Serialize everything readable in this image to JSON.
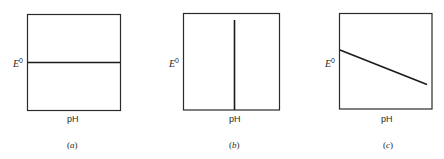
{
  "figure": {
    "panels": [
      {
        "id": "a",
        "caption_letter": "a",
        "ylabel_symbol": "E",
        "ylabel_superscript": "0",
        "xlabel": "pH",
        "line_type": "horizontal"
      },
      {
        "id": "b",
        "caption_letter": "b",
        "ylabel_symbol": "E",
        "ylabel_superscript": "0",
        "xlabel": "pH",
        "line_type": "vertical"
      },
      {
        "id": "c",
        "caption_letter": "c",
        "ylabel_symbol": "E",
        "ylabel_superscript": "0",
        "xlabel": "pH",
        "line_type": "decreasing"
      }
    ],
    "colors": {
      "line": "#1a1a1a",
      "frame": "#2a2a2a",
      "text": "#2a2a2a"
    }
  }
}
